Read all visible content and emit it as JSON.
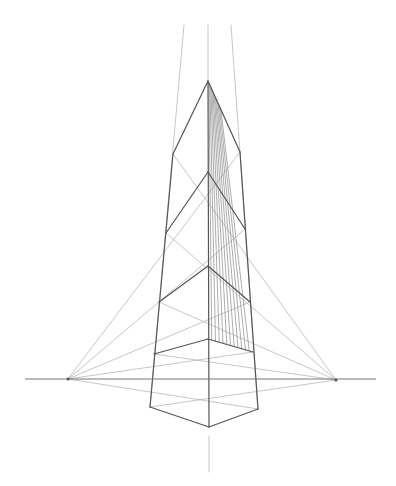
{
  "title": "Three-point perspective tower drawing",
  "colors": {
    "background": "#ffffff",
    "guide": "#b8b8b8",
    "edge": "#555555",
    "hatch": "#8a8a8a",
    "horizon": "#777777"
  },
  "horizon": {
    "y": 379,
    "x1": 25,
    "x2": 376
  },
  "vanishing_points": {
    "left": {
      "x": 68,
      "y": 379
    },
    "right": {
      "x": 336,
      "y": 380
    },
    "top": {
      "x": 208,
      "y": 0
    }
  },
  "top_guides": [
    {
      "x1": 184,
      "y1": 25,
      "x2": 150,
      "y2": 407
    },
    {
      "x1": 208,
      "y1": 25,
      "x2": 208,
      "y2": 81
    },
    {
      "x1": 231,
      "y1": 25,
      "x2": 258,
      "y2": 409
    }
  ],
  "bottom_guide": {
    "x1": 209,
    "y1": 436,
    "x2": 209,
    "y2": 472
  },
  "vertices": {
    "apex": [
      208,
      81
    ],
    "left_shoulder": [
      173,
      154
    ],
    "right_shoulder": [
      240,
      152
    ],
    "center_1": [
      208,
      172
    ],
    "left_1": [
      166,
      233
    ],
    "right_1": [
      245,
      229
    ],
    "center_2": [
      208,
      266
    ],
    "left_2": [
      159,
      302
    ],
    "right_2": [
      250,
      302
    ],
    "center_3": [
      208,
      339
    ],
    "left_3": [
      154,
      354
    ],
    "right_3": [
      253,
      352
    ],
    "bottom_left": [
      150,
      407
    ],
    "bottom_center": [
      209,
      427
    ],
    "bottom_right": [
      258,
      409
    ]
  },
  "hatch_count": 11
}
